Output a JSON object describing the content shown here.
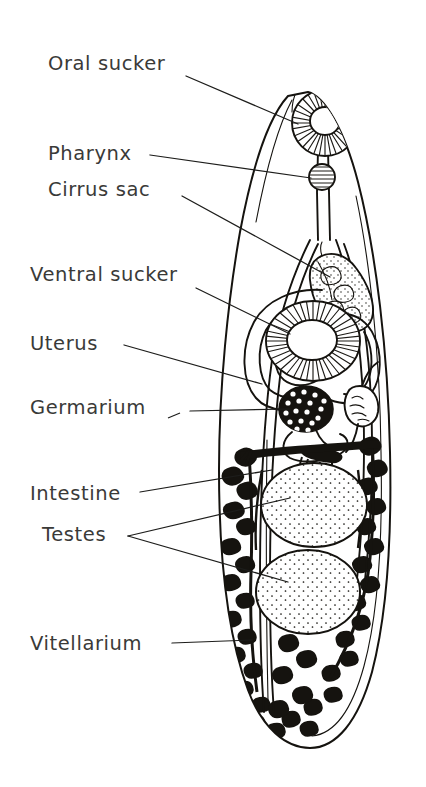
{
  "figure": {
    "background_color": "#ffffff",
    "ink_color": "#15130f",
    "text_color": "#3a3a38",
    "orientation": "ventral view, anterior at top"
  },
  "labels": [
    {
      "id": "oral-sucker",
      "text": "Oral sucker",
      "x": 48,
      "y": 70
    },
    {
      "id": "pharynx",
      "text": "Pharynx",
      "x": 48,
      "y": 160
    },
    {
      "id": "cirrus-sac",
      "text": "Cirrus sac",
      "x": 48,
      "y": 196
    },
    {
      "id": "ventral-sucker",
      "text": "Ventral sucker",
      "x": 30,
      "y": 281
    },
    {
      "id": "uterus",
      "text": "Uterus",
      "x": 30,
      "y": 350
    },
    {
      "id": "germarium",
      "text": "Germarium",
      "x": 30,
      "y": 414
    },
    {
      "id": "intestine",
      "text": "Intestine",
      "x": 30,
      "y": 500
    },
    {
      "id": "testes",
      "text": "Testes",
      "x": 42,
      "y": 541
    },
    {
      "id": "vitellarium",
      "text": "Vitellarium",
      "x": 30,
      "y": 650
    }
  ],
  "organs": [
    {
      "id": "oral-sucker",
      "name": "Oral sucker",
      "appearance": "radially striated ring at anterior tip"
    },
    {
      "id": "pharynx",
      "name": "Pharynx",
      "appearance": "small striated sphere below oral sucker"
    },
    {
      "id": "cirrus-sac",
      "name": "Cirrus sac",
      "appearance": "stippled sac with coiled seminal vesicle, right of midline"
    },
    {
      "id": "ventral-sucker",
      "name": "Ventral sucker",
      "appearance": "large radially striated acetabulum, mid body"
    },
    {
      "id": "uterus",
      "name": "Uterus",
      "appearance": "nested looping coils encircling ventral sucker"
    },
    {
      "id": "germarium",
      "name": "Germarium",
      "appearance": "dark ovary disc with pale dots"
    },
    {
      "id": "intestine",
      "name": "Intestine",
      "appearance": "paired caeca running full body length"
    },
    {
      "id": "testes",
      "name": "Testes",
      "appearance": "two large stippled ovoid bodies in tandem"
    },
    {
      "id": "vitellarium",
      "name": "Vitellarium",
      "appearance": "dense black branching follicles along both lateral margins"
    }
  ]
}
